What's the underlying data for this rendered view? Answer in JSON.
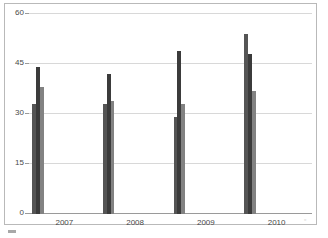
{
  "figure": {
    "background_color": "#ffffff",
    "frame_color": "#b9b9b9",
    "gridline_color": "#d8d8d8",
    "axis_color": "#9a9a9a",
    "tick_text_color": "#4a4a4a"
  },
  "artifact": {
    "mark": "▫"
  },
  "chart_data": {
    "type": "bar",
    "title": "",
    "subtitle": "",
    "xlabel": "",
    "ylabel": "",
    "categories": [
      "2007",
      "2008",
      "2009",
      "2010"
    ],
    "series": [
      {
        "name": "Series 1",
        "color": "#555555",
        "values": [
          33,
          33,
          29,
          54
        ]
      },
      {
        "name": "Series 2",
        "color": "#3b3b3b",
        "values": [
          44,
          42,
          49,
          48
        ]
      },
      {
        "name": "Series 3",
        "color": "#828282",
        "values": [
          38,
          34,
          33,
          37
        ]
      }
    ],
    "ylim": [
      0,
      60
    ],
    "yticks": [
      0,
      15,
      30,
      45,
      60
    ],
    "ytick_labels": [
      "0",
      "15",
      "30",
      "45",
      "60"
    ],
    "grid": true,
    "grid_axis": "y",
    "legend": false,
    "legend_position": "none",
    "bar_group_gap_ratio": 0.35
  }
}
